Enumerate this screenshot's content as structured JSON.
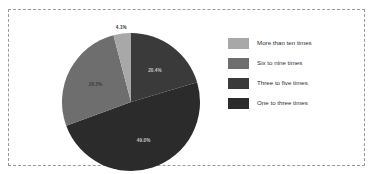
{
  "chart_data": {
    "type": "pie",
    "title": "",
    "subtitle": "",
    "xlabel": "",
    "ylabel": "",
    "grid": false,
    "legend_position": "right",
    "start_angle_deg": 0,
    "direction": "clockwise",
    "categories": [
      "One to three times",
      "Three to five times",
      "Six to nine times",
      "More than ten times"
    ],
    "values": [
      20.4,
      49.0,
      26.5,
      4.1
    ],
    "value_unit": "%",
    "slices": [
      {
        "label": "One to three times",
        "value": 20.4,
        "value_label": "20.4%",
        "color": "#3a3a3a",
        "label_color": "#c9c9c9",
        "label_inside": true
      },
      {
        "label": "Three to five times",
        "value": 49.0,
        "value_label": "49.0%",
        "color": "#2b2b2b",
        "label_color": "#c9c9c9",
        "label_inside": true
      },
      {
        "label": "Six to nine times",
        "value": 26.5,
        "value_label": "26.5%",
        "color": "#6e6e6e",
        "label_color": "#3c3c3c",
        "label_inside": true
      },
      {
        "label": "More than ten times",
        "value": 4.1,
        "value_label": "4.1%",
        "color": "#a8a8a8",
        "label_color": "#333333",
        "label_inside": false
      }
    ]
  },
  "legend": {
    "items": [
      {
        "label": "More than ten times",
        "color": "#a8a8a8"
      },
      {
        "label": "Six to nine times",
        "color": "#6e6e6e"
      },
      {
        "label": "Three to five times",
        "color": "#3a3a3a"
      },
      {
        "label": "One to three times",
        "color": "#2b2b2b"
      }
    ]
  },
  "frame": {
    "border_color": "#9a9a9a",
    "background": "#ffffff"
  }
}
